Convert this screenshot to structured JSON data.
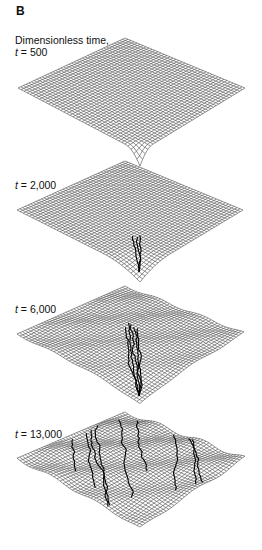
{
  "figure": {
    "panel_label": "B",
    "heading": "Dimensionless time,",
    "panels": [
      {
        "var": "t",
        "eq": " = ",
        "value": "500",
        "stage": 0
      },
      {
        "var": "t",
        "eq": " = ",
        "value": "2,000",
        "stage": 1
      },
      {
        "var": "t",
        "eq": " = ",
        "value": "6,000",
        "stage": 2
      },
      {
        "var": "t",
        "eq": " = ",
        "value": "13,000",
        "stage": 3
      }
    ],
    "colors": {
      "mesh": "#3a3a3a",
      "channel": "#000000",
      "background": "#ffffff"
    }
  }
}
